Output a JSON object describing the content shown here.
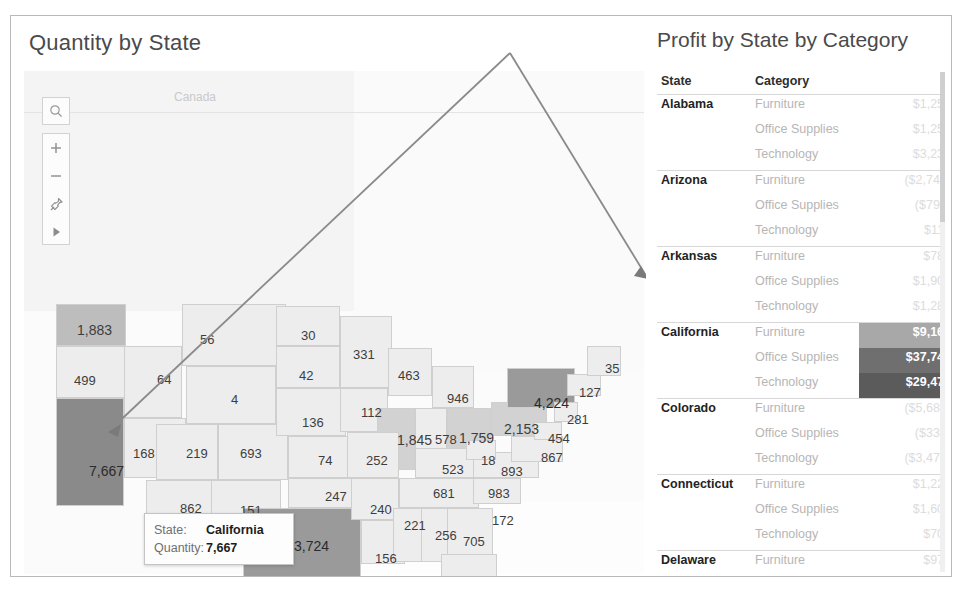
{
  "map_panel": {
    "title": "Quantity by State",
    "region_label": "Canada",
    "toolbar": [
      {
        "name": "search-icon",
        "glyph": "search"
      },
      {
        "name": "zoom-in-icon",
        "glyph": "plus"
      },
      {
        "name": "zoom-out-icon",
        "glyph": "minus"
      },
      {
        "name": "pin-fix-icon",
        "glyph": "pin"
      },
      {
        "name": "play-expand-icon",
        "glyph": "play"
      }
    ],
    "tooltip": {
      "state_label": "State:",
      "state_value": "California",
      "quantity_label": "Quantity:",
      "quantity_value": "7,667"
    },
    "state_values": [
      {
        "state": "Washington",
        "value": "1,883",
        "x": 66,
        "y": 306,
        "level": 4
      },
      {
        "state": "Oregon",
        "value": "499",
        "x": 63,
        "y": 357,
        "level": 1
      },
      {
        "state": "Idaho",
        "value": "64",
        "x": 146,
        "y": 356,
        "level": 1
      },
      {
        "state": "Montana",
        "value": "56",
        "x": 189,
        "y": 316,
        "level": 1
      },
      {
        "state": "Wyoming",
        "value": "4",
        "x": 220,
        "y": 376,
        "level": 1
      },
      {
        "state": "North Dakota",
        "value": "30",
        "x": 290,
        "y": 312,
        "level": 1
      },
      {
        "state": "South Dakota",
        "value": "42",
        "x": 288,
        "y": 352,
        "level": 1
      },
      {
        "state": "Nebraska",
        "value": "136",
        "x": 291,
        "y": 399,
        "level": 1
      },
      {
        "state": "Minnesota",
        "value": "331",
        "x": 342,
        "y": 331,
        "level": 1
      },
      {
        "state": "Iowa",
        "value": "112",
        "x": 350,
        "y": 389,
        "level": 1
      },
      {
        "state": "Wisconsin",
        "value": "463",
        "x": 387,
        "y": 352,
        "level": 1
      },
      {
        "state": "California",
        "value": "7,667",
        "x": 78,
        "y": 447,
        "level": 6
      },
      {
        "state": "Nevada",
        "value": "168",
        "x": 122,
        "y": 430,
        "level": 1
      },
      {
        "state": "Utah",
        "value": "219",
        "x": 175,
        "y": 430,
        "level": 1
      },
      {
        "state": "Colorado",
        "value": "693",
        "x": 229,
        "y": 430,
        "level": 1
      },
      {
        "state": "Kansas",
        "value": "74",
        "x": 307,
        "y": 437,
        "level": 1
      },
      {
        "state": "Missouri",
        "value": "252",
        "x": 355,
        "y": 437,
        "level": 1
      },
      {
        "state": "Arizona",
        "value": "862",
        "x": 169,
        "y": 485,
        "level": 1
      },
      {
        "state": "New Mexico",
        "value": "151",
        "x": 229,
        "y": 487,
        "level": 1
      },
      {
        "state": "Oklahoma",
        "value": "247",
        "x": 314,
        "y": 473,
        "level": 1
      },
      {
        "state": "Arkansas",
        "value": "240",
        "x": 359,
        "y": 486,
        "level": 1
      },
      {
        "state": "Texas",
        "value": "3,724",
        "x": 283,
        "y": 522,
        "level": 5
      },
      {
        "state": "Louisiana",
        "value": "156",
        "x": 364,
        "y": 535,
        "level": 1
      },
      {
        "state": "Mississippi",
        "value": "221",
        "x": 393,
        "y": 502,
        "level": 1
      },
      {
        "state": "Alabama",
        "value": "256",
        "x": 424,
        "y": 512,
        "level": 1
      },
      {
        "state": "Georgia",
        "value": "705",
        "x": 452,
        "y": 518,
        "level": 1
      },
      {
        "state": "Tennessee",
        "value": "681",
        "x": 422,
        "y": 470,
        "level": 1
      },
      {
        "state": "Kentucky",
        "value": "523",
        "x": 431,
        "y": 446,
        "level": 1
      },
      {
        "state": "Illinois",
        "value": "1,845",
        "x": 386,
        "y": 416,
        "level": 3
      },
      {
        "state": "Indiana",
        "value": "578",
        "x": 424,
        "y": 416,
        "level": 1
      },
      {
        "state": "Ohio",
        "value": "1,759",
        "x": 448,
        "y": 414,
        "level": 3
      },
      {
        "state": "Michigan",
        "value": "946",
        "x": 436,
        "y": 375,
        "level": 1
      },
      {
        "state": "Pennsylvania",
        "value": "2,153",
        "x": 493,
        "y": 405,
        "level": 3
      },
      {
        "state": "New York",
        "value": "4,224",
        "x": 523,
        "y": 379,
        "level": 5
      },
      {
        "state": "Vermont/NH",
        "value": "35",
        "x": 594,
        "y": 345,
        "level": 1
      },
      {
        "state": "Massachusetts",
        "value": "127",
        "x": 568,
        "y": 369,
        "level": 1
      },
      {
        "state": "New Jersey",
        "value": "281",
        "x": 556,
        "y": 396,
        "level": 1
      },
      {
        "state": "Maryland",
        "value": "454",
        "x": 537,
        "y": 415,
        "level": 1
      },
      {
        "state": "Virginia",
        "value": "867",
        "x": 530,
        "y": 434,
        "level": 1
      },
      {
        "state": "West Virginia",
        "value": "18",
        "x": 470,
        "y": 437,
        "level": 1
      },
      {
        "state": "North Carolina",
        "value": "893",
        "x": 490,
        "y": 448,
        "level": 1
      },
      {
        "state": "South Carolina",
        "value": "983",
        "x": 477,
        "y": 470,
        "level": 1
      },
      {
        "state": "Florida",
        "value": "1,379",
        "x": 459,
        "y": 560,
        "level": 1
      },
      {
        "state": "Delaware",
        "value": "172",
        "x": 481,
        "y": 497,
        "level": 1
      }
    ]
  },
  "table_panel": {
    "title": "Profit by State by Category",
    "headers": {
      "state": "State",
      "category": "Category"
    },
    "rows": [
      {
        "state": "Alabama",
        "category": "Furniture",
        "value": "$1,251",
        "group_start": true,
        "highlight": ""
      },
      {
        "state": "",
        "category": "Office Supplies",
        "value": "$1,258",
        "group_start": false,
        "highlight": ""
      },
      {
        "state": "",
        "category": "Technology",
        "value": "$3,236",
        "group_start": false,
        "highlight": ""
      },
      {
        "state": "Arizona",
        "category": "Furniture",
        "value": "($2,745)",
        "group_start": true,
        "highlight": ""
      },
      {
        "state": "",
        "category": "Office Supplies",
        "value": "($796)",
        "group_start": false,
        "highlight": ""
      },
      {
        "state": "",
        "category": "Technology",
        "value": "$113",
        "group_start": false,
        "highlight": ""
      },
      {
        "state": "Arkansas",
        "category": "Furniture",
        "value": "$781",
        "group_start": true,
        "highlight": ""
      },
      {
        "state": "",
        "category": "Office Supplies",
        "value": "$1,900",
        "group_start": false,
        "highlight": ""
      },
      {
        "state": "",
        "category": "Technology",
        "value": "$1,281",
        "group_start": false,
        "highlight": ""
      },
      {
        "state": "California",
        "category": "Furniture",
        "value": "$9,163",
        "group_start": true,
        "highlight": "hi1"
      },
      {
        "state": "",
        "category": "Office Supplies",
        "value": "$37,748",
        "group_start": false,
        "highlight": "hi2"
      },
      {
        "state": "",
        "category": "Technology",
        "value": "$29,470",
        "group_start": false,
        "highlight": "hi3"
      },
      {
        "state": "Colorado",
        "category": "Furniture",
        "value": "($5,686)",
        "group_start": true,
        "highlight": ""
      },
      {
        "state": "",
        "category": "Office Supplies",
        "value": "($333)",
        "group_start": false,
        "highlight": ""
      },
      {
        "state": "",
        "category": "Technology",
        "value": "($3,472)",
        "group_start": false,
        "highlight": ""
      },
      {
        "state": "Connecticut",
        "category": "Furniture",
        "value": "$1,225",
        "group_start": true,
        "highlight": ""
      },
      {
        "state": "",
        "category": "Office Supplies",
        "value": "$1,604",
        "group_start": false,
        "highlight": ""
      },
      {
        "state": "",
        "category": "Technology",
        "value": "$701",
        "group_start": false,
        "highlight": ""
      },
      {
        "state": "Delaware",
        "category": "Furniture",
        "value": "$971",
        "group_start": true,
        "highlight": ""
      },
      {
        "state": "",
        "category": "Office Supplies",
        "value": "$2,868",
        "group_start": false,
        "highlight": ""
      },
      {
        "state": "",
        "category": "Technology",
        "value": "$4,238",
        "group_start": false,
        "highlight": ""
      },
      {
        "state": "District of Columbia",
        "category": "Furniture",
        "value": "$550",
        "group_start": true,
        "highlight": ""
      },
      {
        "state": "",
        "category": "Office Supplies",
        "value": "$61",
        "group_start": false,
        "highlight": ""
      },
      {
        "state": "",
        "category": "Technology",
        "value": "$410",
        "group_start": false,
        "highlight": ""
      }
    ]
  }
}
